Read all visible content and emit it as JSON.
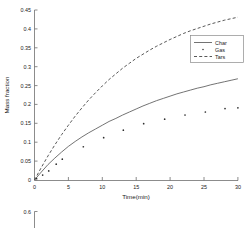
{
  "figure": {
    "background_color": "#ffffff",
    "axis_color": "#6e6e6e",
    "text_color": "#1a1a1a"
  },
  "chart_data": {
    "type": "line",
    "title": "",
    "xlabel": "Time(min)",
    "ylabel": "Mass fraction",
    "xlim": [
      0,
      30
    ],
    "ylim": [
      0,
      0.45
    ],
    "xticks": [
      0,
      5,
      10,
      15,
      20,
      25,
      30
    ],
    "xtick_labels": [
      "0",
      "5",
      "10",
      "15",
      "20",
      "25",
      "30"
    ],
    "yticks": [
      0,
      0.05,
      0.1,
      0.15,
      0.2,
      0.25,
      0.3,
      0.35,
      0.4,
      0.45
    ],
    "ytick_labels": [
      "0",
      "0.05",
      "0.1",
      "0.15",
      "0.2",
      "0.25",
      "0.3",
      "0.35",
      "0.4",
      "0.45"
    ],
    "grid": false,
    "legend_position": "upper right",
    "legend_entries": [
      {
        "label": "Char",
        "marker": "solid-line"
      },
      {
        "label": "Gas",
        "marker": "dot"
      },
      {
        "label": "Tars",
        "marker": "dashed-line"
      }
    ],
    "series": [
      {
        "name": "Char",
        "style": "solid-line",
        "color": "#5a5a5a",
        "x": [
          0,
          1,
          2,
          3,
          4,
          5,
          6,
          7,
          8,
          9,
          10,
          11,
          12,
          13,
          14,
          15,
          16,
          17,
          18,
          19,
          20,
          21,
          22,
          23,
          24,
          25,
          26,
          27,
          28,
          29,
          30
        ],
        "y": [
          0,
          0.021,
          0.041,
          0.058,
          0.074,
          0.089,
          0.102,
          0.114,
          0.125,
          0.135,
          0.145,
          0.155,
          0.163,
          0.172,
          0.18,
          0.188,
          0.196,
          0.203,
          0.21,
          0.216,
          0.222,
          0.228,
          0.233,
          0.238,
          0.243,
          0.247,
          0.252,
          0.256,
          0.26,
          0.264,
          0.268
        ]
      },
      {
        "name": "Gas",
        "style": "scatter",
        "color": "#2e2e2e",
        "x": [
          0.3,
          1.2,
          2.1,
          3.2,
          4.1,
          7.2,
          10.2,
          13.1,
          16.1,
          19.2,
          22.2,
          25.2,
          28.1,
          30.0
        ],
        "y": [
          0.004,
          0.013,
          0.024,
          0.042,
          0.055,
          0.088,
          0.112,
          0.132,
          0.149,
          0.161,
          0.172,
          0.18,
          0.189,
          0.191
        ]
      },
      {
        "name": "Tars",
        "style": "dashed-line",
        "color": "#3a3a3a",
        "x": [
          0,
          1,
          2,
          3,
          4,
          5,
          6,
          7,
          8,
          9,
          10,
          11,
          12,
          13,
          14,
          15,
          16,
          17,
          18,
          19,
          20,
          21,
          22,
          23,
          24,
          25,
          26,
          27,
          28,
          29,
          30
        ],
        "y": [
          0,
          0.033,
          0.064,
          0.093,
          0.12,
          0.145,
          0.169,
          0.191,
          0.212,
          0.231,
          0.249,
          0.266,
          0.281,
          0.296,
          0.309,
          0.322,
          0.333,
          0.344,
          0.354,
          0.363,
          0.372,
          0.38,
          0.388,
          0.395,
          0.401,
          0.407,
          0.413,
          0.418,
          0.423,
          0.427,
          0.431
        ]
      }
    ]
  },
  "secondary_chart": {
    "type": "line",
    "note": "partially visible cropped axis at bottom of image",
    "ytick_labels": [
      "0.6"
    ],
    "yticks": [
      0.6
    ]
  }
}
